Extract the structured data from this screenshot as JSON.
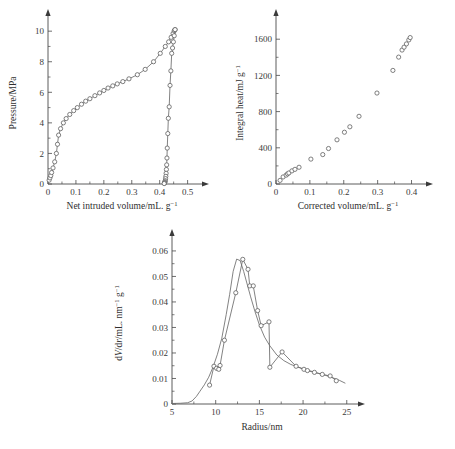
{
  "figure": {
    "background_color": "#ffffff",
    "line_color": "#6b6b6b",
    "axis_color": "#4a4a4a",
    "marker_fill": "#ffffff",
    "panel_count": 3
  },
  "chart_data": [
    {
      "id": "pressure-intrusion",
      "type": "line",
      "title": "",
      "xlabel": "Net intruded volume/mL. g",
      "xlabel_sup": "−1",
      "ylabel": "Pressure/MPa",
      "ylabel_sup": "",
      "xlim": [
        0,
        0.53
      ],
      "ylim": [
        0,
        10.6
      ],
      "xticks": [
        0,
        0.1,
        0.2,
        0.3,
        0.4,
        0.5
      ],
      "xtick_labels": [
        "0",
        "0.1",
        "0.2",
        "0.3",
        "0.4",
        "0.5"
      ],
      "yticks": [
        0,
        2,
        4,
        6,
        8,
        10
      ],
      "ytick_labels": [
        "0",
        "2",
        "4",
        "6",
        "8",
        "10"
      ],
      "xminor": [
        0.05,
        0.15,
        0.25,
        0.35,
        0.45
      ],
      "yminor": [
        1,
        3,
        5,
        7,
        9
      ],
      "grid": false,
      "legend": "none",
      "series": [
        {
          "name": "intrusion",
          "marker": "open-circle",
          "x": [
            0.004,
            0.007,
            0.01,
            0.013,
            0.018,
            0.024,
            0.03,
            0.034,
            0.038,
            0.045,
            0.055,
            0.065,
            0.078,
            0.092,
            0.105,
            0.12,
            0.135,
            0.15,
            0.168,
            0.185,
            0.2,
            0.215,
            0.232,
            0.248,
            0.268,
            0.29,
            0.32,
            0.348,
            0.378,
            0.402,
            0.42,
            0.432,
            0.441,
            0.448,
            0.452,
            0.455
          ],
          "y": [
            0.25,
            0.4,
            0.55,
            0.75,
            1.05,
            1.45,
            2.0,
            2.6,
            3.2,
            3.62,
            4.0,
            4.28,
            4.55,
            4.8,
            5.0,
            5.22,
            5.42,
            5.58,
            5.78,
            5.96,
            6.12,
            6.28,
            6.42,
            6.55,
            6.7,
            6.88,
            7.15,
            7.5,
            8.0,
            8.55,
            9.0,
            9.3,
            9.6,
            9.85,
            10.02,
            10.1
          ]
        },
        {
          "name": "extrusion",
          "marker": "open-circle",
          "x": [
            0.455,
            0.452,
            0.449,
            0.446,
            0.443,
            0.44,
            0.437,
            0.434,
            0.431,
            0.429,
            0.427,
            0.426,
            0.425,
            0.424,
            0.423,
            0.422,
            0.421,
            0.42,
            0.419,
            0.418,
            0.417,
            0.416
          ],
          "y": [
            10.1,
            9.7,
            9.3,
            8.9,
            8.55,
            7.4,
            6.45,
            5.05,
            4.3,
            3.3,
            2.35,
            1.7,
            1.25,
            0.95,
            0.7,
            0.5,
            0.35,
            0.22,
            0.15,
            0.1,
            0.06,
            0.03
          ]
        }
      ]
    },
    {
      "id": "integral-heat",
      "type": "scatter",
      "title": "",
      "xlabel": "Corrected volume/mL. g",
      "xlabel_sup": "−1",
      "ylabel": "Integral heat/mJ g",
      "ylabel_sup": "−1",
      "xlim": [
        0,
        0.425
      ],
      "ylim": [
        0,
        1790
      ],
      "xticks": [
        0,
        0.1,
        0.2,
        0.3,
        0.4
      ],
      "xtick_labels": [
        "0",
        "0.1",
        "0.2",
        "0.3",
        "0.4"
      ],
      "yticks": [
        0,
        400,
        800,
        1200,
        1600
      ],
      "ytick_labels": [
        "0",
        "400",
        "800",
        "1200",
        "1600"
      ],
      "xminor": [
        0.05,
        0.15,
        0.25,
        0.35
      ],
      "yminor": [
        200,
        600,
        1000,
        1400
      ],
      "grid": false,
      "legend": "none",
      "series": [
        {
          "name": "integral heat",
          "marker": "open-circle",
          "x": [
            0.012,
            0.021,
            0.03,
            0.034,
            0.038,
            0.047,
            0.056,
            0.068,
            0.103,
            0.138,
            0.155,
            0.18,
            0.202,
            0.218,
            0.245,
            0.298,
            0.345,
            0.362,
            0.372,
            0.378,
            0.385,
            0.392,
            0.396
          ],
          "y": [
            40,
            78,
            98,
            112,
            122,
            145,
            162,
            185,
            275,
            325,
            392,
            488,
            572,
            632,
            748,
            1005,
            1255,
            1402,
            1480,
            1512,
            1548,
            1592,
            1618
          ]
        }
      ]
    },
    {
      "id": "pore-size-distribution",
      "type": "line",
      "title": "",
      "xlabel": "Radius/nm",
      "xlabel_sup": "",
      "ylabel_prefix": "d",
      "ylabel_var": "V",
      "ylabel_mid": "/d",
      "ylabel_var2": "r",
      "ylabel_suffix": "/mL. nm",
      "ylabel_sup": "−1",
      "ylabel_tail": " g",
      "ylabel_sup2": "−1",
      "xlim": [
        5,
        25.6
      ],
      "ylim": [
        0,
        0.0635
      ],
      "xticks": [
        5,
        10,
        15,
        20,
        25
      ],
      "xtick_labels": [
        "5",
        "10",
        "15",
        "20",
        "25"
      ],
      "yticks": [
        0,
        0.01,
        0.02,
        0.03,
        0.04,
        0.05,
        0.06
      ],
      "ytick_labels": [
        "0",
        "0.01",
        "0.02",
        "0.03",
        "0.04",
        "0.05",
        "0.06"
      ],
      "xminor": [
        7.5,
        12.5,
        17.5,
        22.5
      ],
      "yminor": [
        0.005,
        0.015,
        0.025,
        0.035,
        0.045,
        0.055
      ],
      "grid": false,
      "legend": "none",
      "series": [
        {
          "name": "dV/dr curve",
          "marker": "none",
          "x": [
            5.0,
            6.0,
            6.8,
            7.3,
            7.8,
            8.2,
            8.7,
            9.2,
            9.7,
            10.2,
            10.7,
            11.2,
            11.6,
            12.0,
            12.4,
            12.8,
            13.2,
            13.6,
            14.0,
            14.5,
            15.0,
            15.6,
            16.2,
            17.0,
            17.8,
            18.6,
            19.4,
            20.2,
            21.0,
            21.8,
            22.6,
            23.4,
            24.2,
            24.8
          ],
          "y": [
            0.0002,
            0.0003,
            0.0005,
            0.0012,
            0.003,
            0.005,
            0.0075,
            0.0105,
            0.0145,
            0.0195,
            0.0258,
            0.035,
            0.043,
            0.052,
            0.0568,
            0.0562,
            0.052,
            0.047,
            0.042,
            0.0362,
            0.031,
            0.0262,
            0.0228,
            0.0192,
            0.017,
            0.0155,
            0.0145,
            0.0135,
            0.0128,
            0.012,
            0.0112,
            0.0103,
            0.0092,
            0.0082
          ]
        },
        {
          "name": "dV/dr points",
          "marker": "open-circle",
          "x": [
            9.3,
            9.8,
            10.1,
            10.35,
            10.5,
            11.0,
            12.3,
            13.1,
            13.7,
            13.9,
            14.3,
            14.8,
            15.2,
            16.1,
            16.2,
            17.6,
            19.2,
            20.1,
            20.5,
            21.3,
            22.2,
            23.1,
            23.8
          ],
          "y": [
            0.0074,
            0.0148,
            0.014,
            0.0136,
            0.0151,
            0.025,
            0.0436,
            0.0567,
            0.0528,
            0.0463,
            0.0463,
            0.0366,
            0.0307,
            0.0322,
            0.0144,
            0.0204,
            0.0148,
            0.0136,
            0.0131,
            0.0124,
            0.0116,
            0.011,
            0.0091
          ]
        }
      ]
    }
  ]
}
